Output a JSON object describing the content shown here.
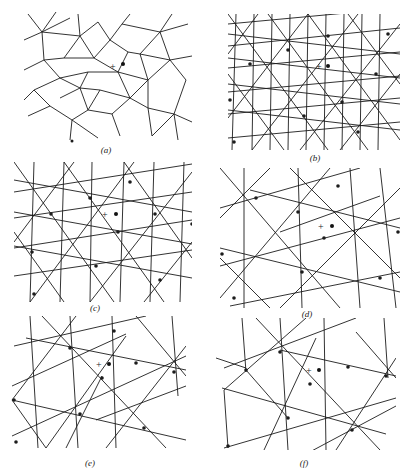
{
  "figure": {
    "panels": [
      {
        "id": "a",
        "label": "(a)",
        "pattern": "octagonal-quasicrystal-tiling-dense"
      },
      {
        "id": "b",
        "label": "(b)",
        "pattern": "triangulated-tiling-dense"
      },
      {
        "id": "c",
        "label": "(c)",
        "pattern": "triangulated-tiling-medium"
      },
      {
        "id": "d",
        "label": "(d)",
        "pattern": "triangulated-tiling-coarse"
      },
      {
        "id": "e",
        "label": "(e)",
        "pattern": "triangulated-tiling-coarser"
      },
      {
        "id": "f",
        "label": "(f)",
        "pattern": "triangulated-tiling-coarsest"
      }
    ],
    "markers": {
      "plus_symbol": "+",
      "dot_symbol": "dot"
    }
  }
}
